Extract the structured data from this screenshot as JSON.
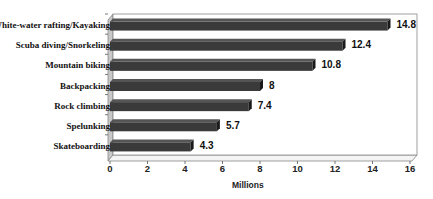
{
  "chart_data": {
    "type": "bar",
    "orientation": "horizontal",
    "style": "3d",
    "title": "",
    "xlabel": "Millions",
    "ylabel": "",
    "categories": [
      "White-water rafting/Kayaking",
      "Scuba diving/Snorkeling",
      "Mountain biking",
      "Backpacking",
      "Rock climbing",
      "Spelunking",
      "Skateboarding"
    ],
    "values": [
      14.8,
      12.4,
      10.8,
      8,
      7.4,
      5.7,
      4.3
    ],
    "value_labels": [
      "14.8",
      "12.4",
      "10.8",
      "8",
      "7.4",
      "5.7",
      "4.3"
    ],
    "xlim": [
      0,
      16
    ],
    "x_ticks": [
      "0",
      "2",
      "4",
      "6",
      "8",
      "10",
      "12",
      "14",
      "16"
    ],
    "grid": false,
    "legend": null,
    "colors": {
      "bar": "#3a3a3a",
      "bar_top": "#555555",
      "bar_end": "#1a1a1a",
      "frame": "#888888",
      "side_wall": "#c8c8c8"
    }
  }
}
